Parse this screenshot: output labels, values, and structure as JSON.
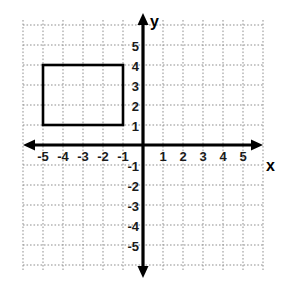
{
  "chart_data": {
    "type": "scatter",
    "title": "",
    "xlabel": "x",
    "ylabel": "y",
    "xlim": [
      -6,
      6
    ],
    "ylim": [
      -6,
      6
    ],
    "grid": true,
    "grid_step": 1,
    "legend": "none",
    "x_tick_labels": [
      "-5",
      "-4",
      "-3",
      "-2",
      "-1",
      "1",
      "2",
      "3",
      "4",
      "5"
    ],
    "x_tick_values": [
      -5,
      -4,
      -3,
      -2,
      -1,
      1,
      2,
      3,
      4,
      5
    ],
    "y_tick_labels": [
      "5",
      "4",
      "3",
      "2",
      "1",
      "-1",
      "-2",
      "-3",
      "-4",
      "-5"
    ],
    "y_tick_values": [
      5,
      4,
      3,
      2,
      1,
      -1,
      -2,
      -3,
      -4,
      -5
    ],
    "shapes": [
      {
        "name": "rectangle",
        "type": "rectangle",
        "vertices": [
          [
            -5,
            4
          ],
          [
            -1,
            4
          ],
          [
            -1,
            1
          ],
          [
            -5,
            1
          ]
        ],
        "x_min": -5,
        "x_max": -1,
        "y_min": 1,
        "y_max": 4,
        "width": 4,
        "height": 3,
        "fill": "none",
        "stroke": "#000000"
      }
    ],
    "axis_arrows": [
      "left",
      "right",
      "up",
      "down"
    ],
    "colors": {
      "axis": "#000000",
      "grid": "#9a9a9a",
      "shape_stroke": "#1a1a1a",
      "background": "#ffffff",
      "label": "#1a1a1a"
    }
  },
  "axes": {
    "x_name": "x",
    "y_name": "y"
  }
}
